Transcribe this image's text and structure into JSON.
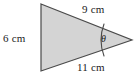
{
  "figure": {
    "type": "triangle-with-angle",
    "shape": {
      "fill_color": "#d4d4d4",
      "stroke_color": "#4a4a4a",
      "stroke_width": 1.2,
      "vertices": [
        {
          "name": "top-left",
          "x": 41,
          "y": 4
        },
        {
          "name": "bottom-left",
          "x": 41,
          "y": 71
        },
        {
          "name": "right-apex",
          "x": 132,
          "y": 40
        }
      ]
    },
    "angle_arc": {
      "color": "#4a4a4a",
      "vertex": "right-apex",
      "radius": 30
    },
    "labels": {
      "left_side": "6 cm",
      "top_side": "9 cm",
      "bottom_side": "11 cm",
      "angle": "θ"
    }
  },
  "background_color": "#ffffff"
}
